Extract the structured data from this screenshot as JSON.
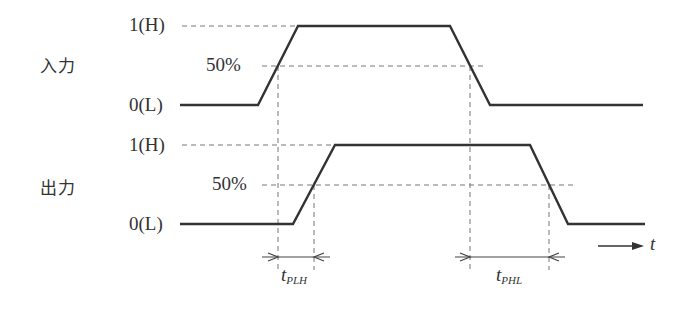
{
  "diagram": {
    "type": "timing-diagram",
    "signals": [
      {
        "name": "入力",
        "high_label": "1(H)",
        "low_label": "0(L)",
        "mid_label": "50%",
        "waveform": {
          "low_start_x": 180,
          "rise_start_x": 258,
          "rise_end_x": 298,
          "fall_start_x": 450,
          "fall_end_x": 490,
          "end_x": 643,
          "y_high": 26,
          "y_low": 105,
          "y_mid": 66,
          "cross_up_x": 278,
          "cross_down_x": 470
        }
      },
      {
        "name": "出力",
        "high_label": "1(H)",
        "low_label": "0(L)",
        "mid_label": "50%",
        "waveform": {
          "low_start_x": 180,
          "rise_start_x": 293,
          "rise_end_x": 335,
          "fall_start_x": 530,
          "fall_end_x": 568,
          "end_x": 645,
          "y_high": 145,
          "y_low": 224,
          "y_mid": 185,
          "cross_up_x": 314,
          "cross_down_x": 549
        }
      }
    ],
    "delays": [
      {
        "label_main": "t",
        "label_sub": "PLH"
      },
      {
        "label_main": "t",
        "label_sub": "PHL"
      }
    ],
    "time_axis_label": "t",
    "colors": {
      "line": "#333333",
      "dashed": "#777777"
    }
  }
}
